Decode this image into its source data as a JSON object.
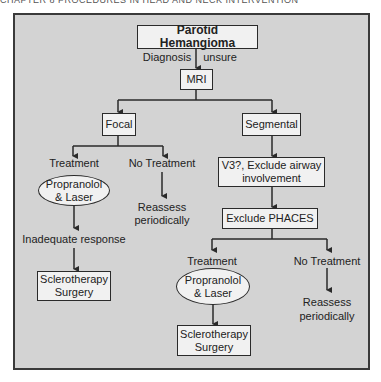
{
  "header": {
    "text": "CHAPTER 8 PROCEDURES IN HEAD AND NECK INTERVENTION"
  },
  "colors": {
    "frame_bg": "#d3d3d3",
    "box_bg": "#f1f1f1",
    "stroke": "#2a2a2a"
  },
  "flowchart": {
    "root": {
      "label": "Parotid Hemangioma"
    },
    "root_edge": {
      "label_left": "Diagnosis",
      "label_right": "unsure"
    },
    "mri": {
      "label": "MRI"
    },
    "focal": {
      "label": "Focal",
      "treatment": {
        "label": "Treatment",
        "therapy_line1": "Propranolol",
        "therapy_line2": "& Laser",
        "outcome": "Inadequate response",
        "next_line1": "Sclerotherapy",
        "next_line2": "Surgery"
      },
      "no_treatment": {
        "label": "No Treatment",
        "action_line1": "Reassess",
        "action_line2": "periodically"
      }
    },
    "segmental": {
      "label": "Segmental",
      "step1_line1": "V3?, Exclude airway",
      "step1_line2": "involvement",
      "step2": "Exclude PHACES",
      "treatment": {
        "label": "Treatment",
        "therapy_line1": "Propranolol",
        "therapy_line2": "& Laser",
        "next_line1": "Sclerotherapy",
        "next_line2": "Surgery"
      },
      "no_treatment": {
        "label": "No Treatment",
        "action_line1": "Reassess",
        "action_line2": "periodically"
      }
    }
  }
}
